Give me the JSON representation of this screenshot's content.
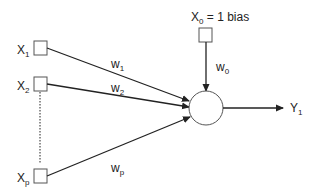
{
  "diagram": {
    "type": "perceptron",
    "inputs": [
      {
        "name": "X",
        "sub": "1",
        "weight": "w",
        "weight_sub": "1"
      },
      {
        "name": "X",
        "sub": "2",
        "weight": "w",
        "weight_sub": "2"
      },
      {
        "name": "X",
        "sub": "p",
        "weight": "w",
        "weight_sub": "p"
      }
    ],
    "bias": {
      "name": "X",
      "sub": "0",
      "suffix": " = 1  bias",
      "weight": "w",
      "weight_sub": "0"
    },
    "output": {
      "name": "Y",
      "sub": "1"
    },
    "colors": {
      "line": "#222222",
      "node_stroke": "#555555"
    }
  }
}
